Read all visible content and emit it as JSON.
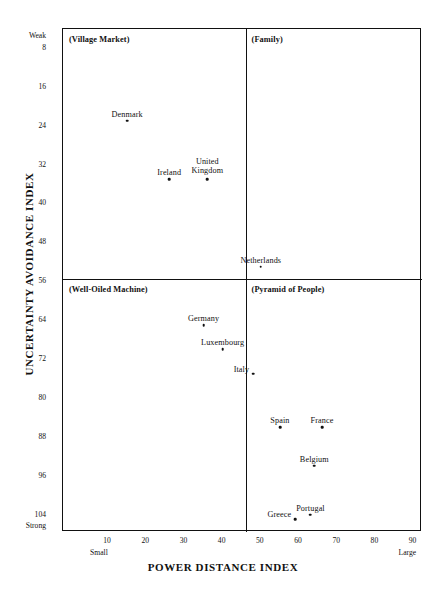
{
  "chart_data": {
    "type": "scatter",
    "title": "",
    "xlabel": "POWER DISTANCE INDEX",
    "ylabel": "UNCERTAINTY AVOIDANCE INDEX",
    "xlim": [
      -1.8,
      92.2
    ],
    "ylim": [
      4.1,
      107.6
    ],
    "grid": false,
    "legend": "none",
    "x_axis": {
      "title": "POWER DISTANCE INDEX",
      "ticks": [
        10,
        20,
        30,
        40,
        50,
        60,
        70,
        80,
        90
      ],
      "tick_labels": [
        "10",
        "20",
        "30",
        "40",
        "50",
        "60",
        "70",
        "80",
        "90"
      ],
      "low_end_caption": "Small",
      "high_end_caption": "Large"
    },
    "y_axis": {
      "title": "UNCERTAINTY AVOIDANCE INDEX",
      "ticks": [
        8,
        16,
        24,
        32,
        40,
        48,
        56,
        64,
        72,
        80,
        88,
        96,
        104
      ],
      "tick_labels": [
        "8",
        "16",
        "24",
        "32",
        "40",
        "48",
        "56",
        "64",
        "72",
        "80",
        "88",
        "96",
        "104"
      ],
      "low_end_caption": "Weak",
      "high_end_caption": "Strong",
      "inverted": true
    },
    "quadrant_divider_x": 46,
    "quadrant_divider_y": 55.5,
    "quadrants": [
      {
        "name": "village-market",
        "label": "(Village Market)",
        "position": "top-left"
      },
      {
        "name": "family",
        "label": "(Family)",
        "position": "top-right"
      },
      {
        "name": "well-oiled-machine",
        "label": "(Well-Oiled Machine)",
        "position": "bottom-left"
      },
      {
        "name": "pyramid-of-people",
        "label": "(Pyramid of People)",
        "position": "bottom-right"
      }
    ],
    "points": [
      {
        "label": "Denmark",
        "x": 15,
        "y": 23,
        "label_pos": "above"
      },
      {
        "label": "Ireland",
        "x": 26,
        "y": 35,
        "label_pos": "above"
      },
      {
        "label": "United Kingdom",
        "x": 36,
        "y": 35,
        "label_pos": "above",
        "label_lines": [
          "United",
          "Kingdom"
        ]
      },
      {
        "label": "Netherlands",
        "x": 50,
        "y": 53,
        "label_pos": "above"
      },
      {
        "label": "Germany",
        "x": 35,
        "y": 65,
        "label_pos": "above"
      },
      {
        "label": "Luxembourg",
        "x": 40,
        "y": 70,
        "label_pos": "above"
      },
      {
        "label": "Italy",
        "x": 48,
        "y": 75,
        "label_pos": "left"
      },
      {
        "label": "Spain",
        "x": 55,
        "y": 86,
        "label_pos": "above"
      },
      {
        "label": "France",
        "x": 66,
        "y": 86,
        "label_pos": "above"
      },
      {
        "label": "Belgium",
        "x": 64,
        "y": 94,
        "label_pos": "above"
      },
      {
        "label": "Portugal",
        "x": 63,
        "y": 104,
        "label_pos": "above"
      },
      {
        "label": "Greece",
        "x": 59,
        "y": 105,
        "label_pos": "left"
      }
    ]
  },
  "colors": {
    "background": "#ffffff",
    "frame": "#111111",
    "point": "#111111",
    "text": "#111111"
  }
}
